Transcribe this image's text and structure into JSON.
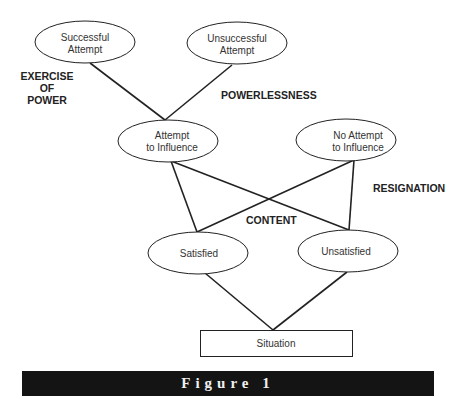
{
  "diagram": {
    "nodes": {
      "successful_attempt": {
        "line1": "Successful",
        "line2": "Attempt"
      },
      "unsuccessful_attempt": {
        "line1": "Unsuccessful",
        "line2": "Attempt"
      },
      "attempt_to_influence": {
        "line1": "Attempt",
        "line2": "to Influence"
      },
      "no_attempt_to_influence": {
        "line1": "No Attempt",
        "line2": "to Influence"
      },
      "satisfied": {
        "label": "Satisfied"
      },
      "unsatisfied": {
        "label": "Unsatisfied"
      },
      "situation": {
        "label": "Situation"
      }
    },
    "region_labels": {
      "exercise_of_power": {
        "line1": "EXERCISE",
        "line2": "OF",
        "line3": "POWER"
      },
      "powerlessness": "POWERLESSNESS",
      "resignation": "RESIGNATION",
      "content": "CONTENT"
    }
  },
  "caption": {
    "label": "Figure 1"
  },
  "colors": {
    "stroke": "#222222",
    "caption_bg": "#141414",
    "caption_text": "#f0f0f0"
  }
}
